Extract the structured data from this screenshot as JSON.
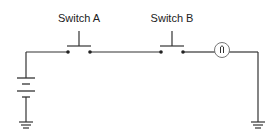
{
  "components": {
    "switch_a": {
      "label": "Switch A",
      "type": "push-button switch (normally open)"
    },
    "switch_b": {
      "label": "Switch B",
      "type": "push-button switch (normally open)"
    },
    "lamp": {
      "type": "light bulb"
    },
    "battery": {
      "type": "battery (two cells)"
    },
    "ground_left": {
      "type": "ground"
    },
    "ground_right": {
      "type": "ground"
    }
  },
  "colors": {
    "wire": "#333333",
    "lamp_circle": "#777777",
    "background": "#ffffff"
  }
}
